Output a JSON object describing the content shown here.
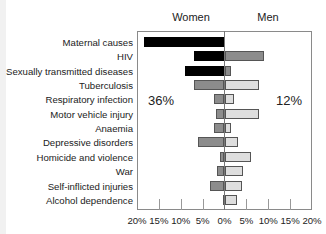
{
  "chart_data": {
    "type": "bar",
    "orientation": "horizontal",
    "layout": "diverging (population pyramid style)",
    "title": "",
    "xlabel": "",
    "ylabel": "",
    "xlim": [
      -20,
      20
    ],
    "grid": false,
    "legend": null,
    "headers": {
      "left": "Women",
      "right": "Men"
    },
    "annotations": [
      {
        "text": "36%",
        "side": "women"
      },
      {
        "text": "12%",
        "side": "men"
      }
    ],
    "x_tick_labels": [
      "20%",
      "15%",
      "10%",
      "5%",
      "0%",
      "5%",
      "10%",
      "15%",
      "20%"
    ],
    "categories": [
      "Maternal causes",
      "HIV",
      "Sexually transmitted diseases",
      "Tuberculosis",
      "Respiratory infection",
      "Motor vehicle injury",
      "Anaemia",
      "Depressive disorders",
      "Homicide and violence",
      "War",
      "Self-inflicted injuries",
      "Alcohol dependence"
    ],
    "series": [
      {
        "name": "Women",
        "values": [
          18.5,
          7,
          9,
          7,
          2.5,
          2,
          2.5,
          6,
          1,
          1.7,
          3.3,
          0.3
        ]
      },
      {
        "name": "Men",
        "values": [
          0,
          9,
          1.5,
          8,
          2.2,
          8,
          1.5,
          3,
          6,
          4.2,
          4,
          2.8
        ]
      }
    ],
    "women_colors": [
      "#000000",
      "#000000",
      "#000000",
      "#8c8c8c",
      "#8c8c8c",
      "#8c8c8c",
      "#8c8c8c",
      "#8c8c8c",
      "#8c8c8c",
      "#8c8c8c",
      "#8c8c8c",
      "#d8d8d8"
    ],
    "men_colors": [
      "#000000",
      "#8c8c8c",
      "#8c8c8c",
      "#dedede",
      "#dedede",
      "#dedede",
      "#dedede",
      "#dedede",
      "#dedede",
      "#dedede",
      "#dedede",
      "#dedede"
    ]
  }
}
